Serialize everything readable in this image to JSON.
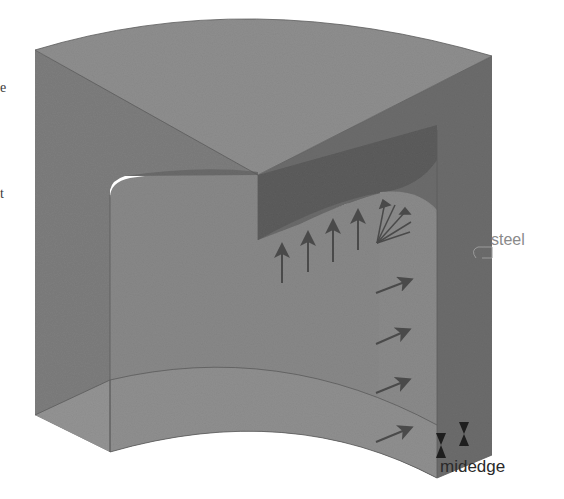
{
  "figure": {
    "colors": {
      "background": "#ffffff",
      "top_face": "#8c8c8c",
      "front_left_face": "#7f7f7f",
      "right_face": "#6e6e6e",
      "cavity_inner": "#858585",
      "cavity_shadow": "#5e5e5e",
      "inner_wall_right": "#8a8a8a",
      "arrow": "#555555",
      "label_dark": "#2a2a2a",
      "label_light": "#8a8a8a"
    }
  },
  "labels": {
    "material": "steel",
    "boundary": "midedge",
    "left_clip_1": "e",
    "left_clip_2": "t"
  },
  "loads": {
    "vertical_pressure_arrows": 4,
    "horizontal_pressure_arrows": 4,
    "fan_arrows": 1
  },
  "constraints": {
    "midedge_markers": 2
  }
}
